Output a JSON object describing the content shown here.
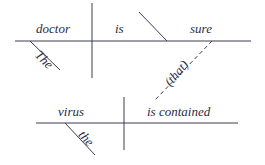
{
  "diagram": {
    "type": "sentence-diagram",
    "main_clause": {
      "subject": "doctor",
      "subject_modifier": "The",
      "verb": "is",
      "predicate_adjective": "sure",
      "connector": "(that)"
    },
    "sub_clause": {
      "subject": "virus",
      "subject_modifier": "the",
      "verb": "is contained"
    },
    "line_color": "#3a3c55",
    "text_color": "#2b2d4a"
  }
}
